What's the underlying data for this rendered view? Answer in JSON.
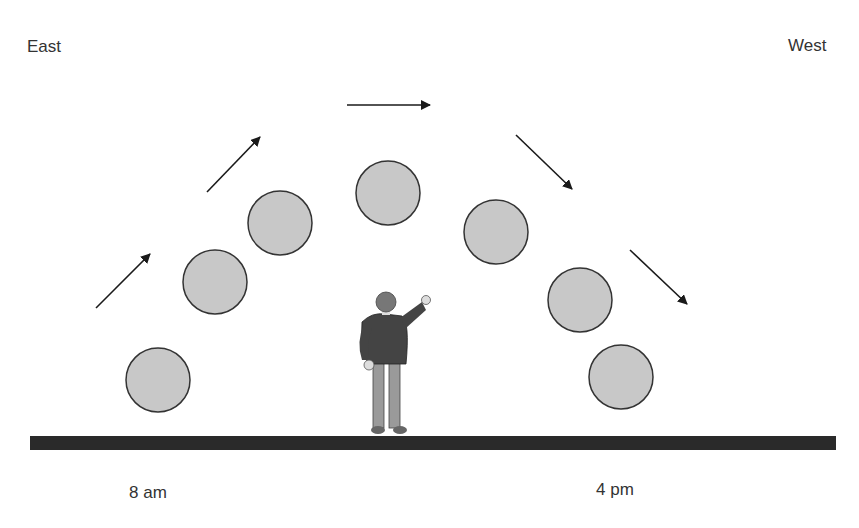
{
  "labels": {
    "east": "East",
    "west": "West",
    "morning": "8 am",
    "afternoon": "4 pm"
  },
  "colors": {
    "sun_fill": "#c8c8c8",
    "sun_stroke": "#333333",
    "ground": "#2a2a2a",
    "arrow": "#1a1a1a",
    "text": "#333333"
  },
  "suns": [
    {
      "cx": 158,
      "cy": 380
    },
    {
      "cx": 215,
      "cy": 282
    },
    {
      "cx": 280,
      "cy": 223
    },
    {
      "cx": 388,
      "cy": 193
    },
    {
      "cx": 496,
      "cy": 232
    },
    {
      "cx": 580,
      "cy": 300
    },
    {
      "cx": 621,
      "cy": 377
    }
  ],
  "arrows": [
    {
      "x1": 96,
      "y1": 308,
      "x2": 150,
      "y2": 254
    },
    {
      "x1": 207,
      "y1": 192,
      "x2": 260,
      "y2": 137
    },
    {
      "x1": 347,
      "y1": 105,
      "x2": 430,
      "y2": 105
    },
    {
      "x1": 516,
      "y1": 135,
      "x2": 572,
      "y2": 189
    },
    {
      "x1": 630,
      "y1": 250,
      "x2": 687,
      "y2": 304
    }
  ]
}
